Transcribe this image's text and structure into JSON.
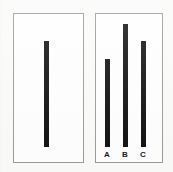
{
  "figure": {
    "background_color": "#fbfbfa",
    "panel_border_color": "#9a9a9a",
    "bar_color": "#0d0d0d",
    "label_color": "#141414"
  },
  "chart_data": [
    {
      "type": "bar",
      "panel_name": "left-panel",
      "title": "",
      "subtitle": "",
      "xlabel": "",
      "ylabel": "",
      "categories": [
        ""
      ],
      "values": [
        106
      ],
      "ylim": [
        0,
        134
      ],
      "grid": false,
      "legend": "none",
      "annotations": [],
      "bars": [
        {
          "label": "",
          "value": 106,
          "x_px": 44,
          "top_px": 41,
          "bottom_px": 147,
          "width_px": 5,
          "height_px": 106,
          "color": "#0d0d0d"
        }
      ]
    },
    {
      "type": "bar",
      "panel_name": "right-panel",
      "title": "",
      "subtitle": "",
      "xlabel": "",
      "ylabel": "",
      "categories": [
        "A",
        "B",
        "C"
      ],
      "values": [
        88,
        123,
        106
      ],
      "ylim": [
        0,
        134
      ],
      "grid": false,
      "legend": "none",
      "annotations": [],
      "tick_labels": [
        "A",
        "B",
        "C"
      ],
      "bars": [
        {
          "label": "A",
          "value": 88,
          "x_px": 105,
          "top_px": 59,
          "bottom_px": 147,
          "width_px": 5,
          "height_px": 88,
          "label_x_px": 101,
          "label_y_px": 150,
          "color": "#0d0d0d"
        },
        {
          "label": "B",
          "value": 123,
          "x_px": 123,
          "top_px": 24,
          "bottom_px": 147,
          "width_px": 5,
          "height_px": 123,
          "label_x_px": 119,
          "label_y_px": 150,
          "color": "#0d0d0d"
        },
        {
          "label": "C",
          "value": 106,
          "x_px": 141,
          "top_px": 41,
          "bottom_px": 147,
          "width_px": 5,
          "height_px": 106,
          "label_x_px": 137,
          "label_y_px": 150,
          "color": "#0d0d0d"
        }
      ]
    }
  ]
}
